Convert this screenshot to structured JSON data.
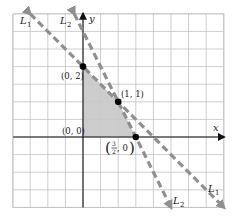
{
  "chart_data": {
    "type": "line",
    "title": "",
    "xlabel": "x",
    "ylabel": "y",
    "xlim": [
      -2,
      4
    ],
    "ylim": [
      -2,
      3.5
    ],
    "grid": true,
    "grid_step": 0.5,
    "lines": [
      {
        "name": "L1",
        "label": "L",
        "sub": "1",
        "equation": "y = 2 - x",
        "slope": -1,
        "intercept": 2,
        "style": "dashed",
        "color": "#8f8f8f"
      },
      {
        "name": "L2",
        "label": "L",
        "sub": "2",
        "equation": "y = 3 - 2x",
        "slope": -2,
        "intercept": 3,
        "style": "dashed",
        "color": "#8f8f8f"
      }
    ],
    "feasible_region": {
      "vertices": [
        [
          0,
          0
        ],
        [
          0,
          2
        ],
        [
          1,
          1
        ],
        [
          1.5,
          0
        ]
      ],
      "color": "#c6c6c6"
    },
    "points": [
      {
        "x": 0,
        "y": 2,
        "label": "(0, 2)"
      },
      {
        "x": 1,
        "y": 1,
        "label": "(1, 1)"
      },
      {
        "x": 1.5,
        "y": 0,
        "label_num": "3",
        "label_den": "2",
        "label_rest": ", 0"
      }
    ],
    "annotations": [
      {
        "text": "(0, 0)",
        "x": 0,
        "y": 0
      }
    ]
  },
  "axis": {
    "x_label": "x",
    "y_label": "y"
  },
  "labels": {
    "p02": "(0, 2)",
    "p11": "(1, 1)",
    "p00": "(0, 0)",
    "frac_num": "3",
    "frac_den": "2",
    "frac_rest": ", 0",
    "open_paren": "(",
    "close_paren": ")",
    "L": "L",
    "sub1": "1",
    "sub2": "2"
  }
}
